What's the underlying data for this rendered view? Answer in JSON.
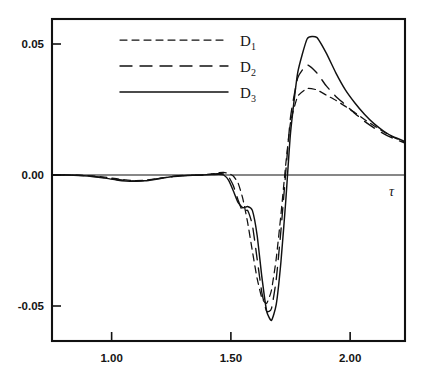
{
  "chart_data": {
    "type": "line",
    "title": "",
    "xlabel": "τ",
    "ylabel": "",
    "xlim": [
      0.75,
      2.23
    ],
    "ylim": [
      -0.064,
      0.06
    ],
    "grid": false,
    "legend_position": "top-center",
    "x_ticks": [
      1.0,
      1.5,
      2.0
    ],
    "x_tick_labels": [
      "1.00",
      "1.50",
      "2.00"
    ],
    "y_ticks": [
      0.05,
      0.0,
      -0.05
    ],
    "y_tick_labels": [
      "0.05",
      "0.00",
      "-0.05"
    ],
    "series": [
      {
        "name": "D1",
        "label": "D",
        "subscript": "1",
        "style": "short-dashed",
        "color": "#111111",
        "x": [
          0.75,
          0.82,
          0.9,
          0.97,
          1.02,
          1.06,
          1.1,
          1.14,
          1.18,
          1.22,
          1.26,
          1.3,
          1.34,
          1.38,
          1.42,
          1.45,
          1.47,
          1.49,
          1.51,
          1.53,
          1.55,
          1.57,
          1.59,
          1.61,
          1.63,
          1.65,
          1.67,
          1.69,
          1.71,
          1.73,
          1.75,
          1.78,
          1.82,
          1.86,
          1.9,
          1.94,
          1.98,
          2.02,
          2.06,
          2.1,
          2.14,
          2.18,
          2.23
        ],
        "y": [
          0.0,
          0.0,
          -0.0002,
          -0.0008,
          -0.0014,
          -0.0019,
          -0.0021,
          -0.002,
          -0.0016,
          -0.001,
          -0.0005,
          -0.0002,
          -0.0001,
          0.0,
          0.0004,
          0.0009,
          0.001,
          0.0006,
          -0.0004,
          -0.003,
          -0.009,
          -0.018,
          -0.029,
          -0.0395,
          -0.047,
          -0.049,
          -0.044,
          -0.032,
          -0.015,
          0.004,
          0.02,
          0.03,
          0.033,
          0.0325,
          0.0305,
          0.0285,
          0.0262,
          0.0238,
          0.0212,
          0.0188,
          0.0165,
          0.0145,
          0.0125
        ]
      },
      {
        "name": "D2",
        "label": "D",
        "subscript": "2",
        "style": "long-dashed",
        "color": "#111111",
        "x": [
          0.75,
          0.82,
          0.9,
          0.97,
          1.02,
          1.06,
          1.1,
          1.14,
          1.18,
          1.22,
          1.26,
          1.3,
          1.34,
          1.38,
          1.42,
          1.45,
          1.47,
          1.49,
          1.51,
          1.53,
          1.55,
          1.57,
          1.59,
          1.61,
          1.63,
          1.65,
          1.67,
          1.69,
          1.71,
          1.73,
          1.75,
          1.78,
          1.82,
          1.86,
          1.9,
          1.94,
          1.98,
          2.02,
          2.06,
          2.1,
          2.14,
          2.18,
          2.23
        ],
        "y": [
          0.0,
          0.0,
          -0.0003,
          -0.001,
          -0.0017,
          -0.0021,
          -0.0023,
          -0.0021,
          -0.0016,
          -0.001,
          -0.0005,
          -0.0002,
          -0.0001,
          0.0,
          0.0003,
          0.0006,
          0.0004,
          -0.0006,
          -0.004,
          -0.0095,
          -0.014,
          -0.0135,
          -0.019,
          -0.032,
          -0.045,
          -0.052,
          -0.051,
          -0.04,
          -0.021,
          0.001,
          0.022,
          0.037,
          0.042,
          0.039,
          0.034,
          0.03,
          0.0268,
          0.0235,
          0.0205,
          0.018,
          0.0158,
          0.014,
          0.0122
        ]
      },
      {
        "name": "D3",
        "label": "D",
        "subscript": "3",
        "style": "solid",
        "color": "#111111",
        "x": [
          0.75,
          0.82,
          0.9,
          0.97,
          1.02,
          1.06,
          1.1,
          1.14,
          1.18,
          1.22,
          1.26,
          1.3,
          1.34,
          1.38,
          1.42,
          1.45,
          1.47,
          1.49,
          1.51,
          1.53,
          1.55,
          1.57,
          1.59,
          1.61,
          1.63,
          1.65,
          1.67,
          1.69,
          1.71,
          1.73,
          1.75,
          1.78,
          1.82,
          1.86,
          1.9,
          1.94,
          1.98,
          2.02,
          2.06,
          2.1,
          2.14,
          2.18,
          2.23
        ],
        "y": [
          0.0,
          0.0,
          -0.0004,
          -0.0012,
          -0.0019,
          -0.0023,
          -0.0024,
          -0.0022,
          -0.0017,
          -0.0011,
          -0.0006,
          -0.0003,
          -0.0001,
          0.0,
          0.0002,
          0.0003,
          0.0,
          -0.002,
          -0.006,
          -0.0105,
          -0.0125,
          -0.012,
          -0.0135,
          -0.023,
          -0.039,
          -0.052,
          -0.0555,
          -0.0495,
          -0.033,
          -0.01,
          0.016,
          0.039,
          0.052,
          0.0525,
          0.0465,
          0.039,
          0.0325,
          0.0275,
          0.0232,
          0.0196,
          0.0168,
          0.0146,
          0.0128
        ]
      }
    ],
    "annotations": []
  },
  "legend": {
    "entries": [
      {
        "label": "D",
        "subscript": "1",
        "style": "short-dashed"
      },
      {
        "label": "D",
        "subscript": "2",
        "style": "long-dashed"
      },
      {
        "label": "D",
        "subscript": "3",
        "style": "solid"
      }
    ]
  },
  "axes": {
    "x_axis_label": "τ"
  }
}
